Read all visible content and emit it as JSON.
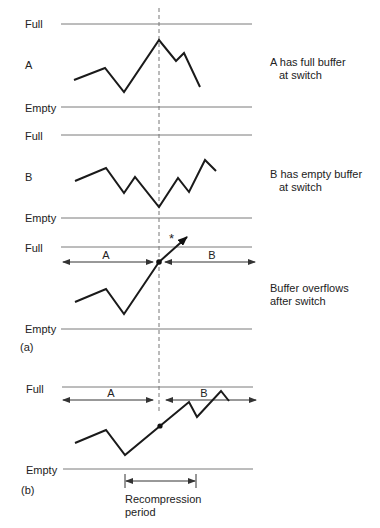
{
  "figure": {
    "panel_a": {
      "tag": "(a)",
      "buffer_a": {
        "name": "A",
        "full_label": "Full",
        "empty_label": "Empty",
        "caption_line1": "A has full buffer",
        "caption_line2": "at switch"
      },
      "buffer_b": {
        "name": "B",
        "full_label": "Full",
        "empty_label": "Empty",
        "caption_line1": "B has empty buffer",
        "caption_line2": "at switch"
      },
      "combined": {
        "full_label": "Full",
        "empty_label": "Empty",
        "segment_a": "A",
        "segment_b": "B",
        "overflow_marker": "*",
        "caption_line1": "Buffer overflows",
        "caption_line2": "after switch"
      }
    },
    "panel_b": {
      "tag": "(b)",
      "full_label": "Full",
      "empty_label": "Empty",
      "segment_a": "A",
      "segment_b": "B",
      "recompression_line1": "Recompression",
      "recompression_line2": "period"
    }
  }
}
